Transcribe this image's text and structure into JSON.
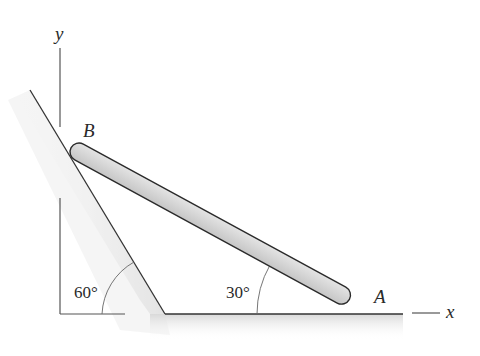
{
  "diagram": {
    "axes": {
      "x_label": "x",
      "y_label": "y"
    },
    "points": {
      "top_end": "B",
      "bottom_end": "A"
    },
    "angles": {
      "wall_angle": "60°",
      "bar_angle": "30°"
    },
    "colors": {
      "line": "#333333",
      "bar_fill": "#d6d6d6",
      "shade": "#e6e6e6",
      "background": "#ffffff"
    }
  }
}
